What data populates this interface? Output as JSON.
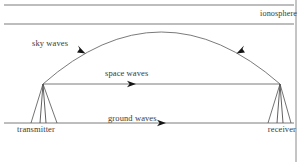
{
  "figure": {
    "labels": {
      "ionosphere": "ionosphere",
      "sky_waves": "sky waves",
      "space_waves": "space waves",
      "ground_waves": "ground waves",
      "transmitter": "transmitter",
      "receiver": "receiver"
    },
    "colors": {
      "line": "#6b6b6b",
      "text": "#3a3a3a",
      "background": "#ffffff",
      "border": "#8a8a8a"
    }
  },
  "diagram_elements": {
    "ionosphere_layer": {
      "upper_boundary_y": 5,
      "lower_boundary_y": 24,
      "x_start": 4,
      "x_end": 294
    },
    "ground_line": {
      "y": 123,
      "x_start": 4,
      "x_end": 294
    },
    "transmitter_tower": {
      "x": 43,
      "top_y": 84,
      "base_y": 123
    },
    "receiver_tower": {
      "x": 280,
      "top_y": 84,
      "base_y": 123
    },
    "sky_wave_arc": {
      "start": [
        43,
        84
      ],
      "peak": [
        161,
        10
      ],
      "end": [
        280,
        84
      ],
      "arrows": [
        [
          82,
          51
        ],
        [
          240,
          51
        ]
      ]
    },
    "space_wave_line": {
      "start": [
        43,
        84
      ],
      "end": [
        280,
        84
      ],
      "arrow": [
        133,
        84
      ]
    },
    "ground_wave_line": {
      "start": [
        4,
        123
      ],
      "end": [
        294,
        123
      ],
      "arrow": [
        163,
        123
      ]
    },
    "frame_border": {
      "right_x": 296
    }
  }
}
